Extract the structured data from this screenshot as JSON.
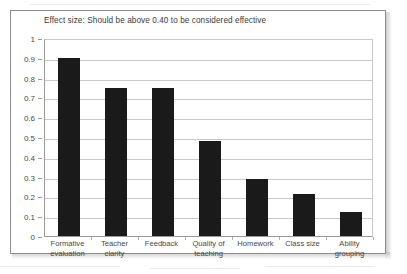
{
  "chart_data": {
    "type": "bar",
    "title": "Effect size: Should be above 0.40 to be considered effective",
    "xlabel": "",
    "ylabel": "",
    "ylim": [
      0,
      1
    ],
    "ytick_labels": [
      "1",
      "0.9",
      "0.8",
      "0.7",
      "0.6",
      "0.5",
      "0.4",
      "0.3",
      "0.2",
      "0.1",
      "0"
    ],
    "ytick_values": [
      1,
      0.9,
      0.8,
      0.7,
      0.6,
      0.5,
      0.4,
      0.3,
      0.2,
      0.1,
      0
    ],
    "grid": true,
    "legend": "none",
    "bar_color": "#1a1a1a",
    "categories": [
      "Formative evaluation",
      "Teacher clarity",
      "Feedback",
      "Quality of teaching",
      "Homework",
      "Class size",
      "Ability grouping"
    ],
    "values": [
      0.9,
      0.75,
      0.75,
      0.48,
      0.29,
      0.21,
      0.12
    ],
    "threshold_note": "0.40"
  },
  "figure": {
    "frame_border_color": "#8c8c8c",
    "background_color": "#ffffff",
    "gridline_color": "#c9c9c9",
    "axis_color": "#9a9a9a",
    "text_color": "#4a4a4a"
  }
}
